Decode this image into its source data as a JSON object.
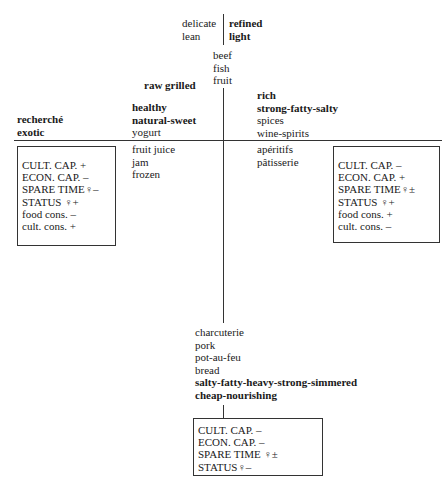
{
  "top": {
    "left_terms": [
      "delicate",
      "lean"
    ],
    "right_terms": [
      "refined",
      "light"
    ],
    "center_terms": [
      "beef",
      "fish",
      "fruit"
    ]
  },
  "upper_left": {
    "far_terms": [
      "recherché",
      "exotic"
    ],
    "raw": "raw grilled",
    "near_terms": [
      "healthy",
      "natural-sweet",
      "yogurt"
    ]
  },
  "upper_right": {
    "near_terms": [
      "rich",
      "strong-fatty-salty",
      "spices",
      "wine-spirits"
    ]
  },
  "lower_left": {
    "near_terms": [
      "fruit juice",
      "jam",
      "frozen"
    ]
  },
  "lower_right": {
    "near_terms": [
      "apéritifs",
      "pâtisserie"
    ]
  },
  "bottom": {
    "terms": [
      "charcuterie",
      "pork",
      "pot-au-feu",
      "bread",
      "salty-fatty-heavy-strong-simmered",
      "cheap-nourishing"
    ]
  },
  "boxes": {
    "left": {
      "rows": [
        "CULT. CAP.  +",
        "ECON. CAP.  –",
        "SPARE TIME♀–",
        "STATUS ♀+",
        "food cons.  –",
        "cult. cons.  +"
      ]
    },
    "right": {
      "rows": [
        "CULT. CAP.  –",
        "ECON. CAP.  +",
        "SPARE TIME♀±",
        "STATUS ♀+",
        "food cons.  +",
        "cult. cons.  –"
      ]
    },
    "bottom": {
      "rows": [
        "CULT. CAP.  –",
        "ECON. CAP.  –",
        "SPARE TIME ♀±",
        "STATUS♀–"
      ]
    }
  }
}
